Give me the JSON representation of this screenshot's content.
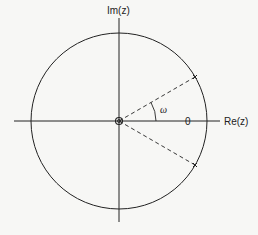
{
  "diagram": {
    "type": "z-plane pole-zero plot",
    "axes": {
      "real_label": "Re(z)",
      "imag_label": "Im(z)"
    },
    "unit_circle": true,
    "zero_marker_label": "0",
    "origin_marker": "double zero (circle)",
    "angle_label": "ω",
    "poles": [
      {
        "marker": "×",
        "position": "upper, angle +ω"
      },
      {
        "marker": "×",
        "position": "lower, angle -ω"
      }
    ],
    "colors": {
      "line": "#222222",
      "background": "#f7f7f5"
    }
  }
}
